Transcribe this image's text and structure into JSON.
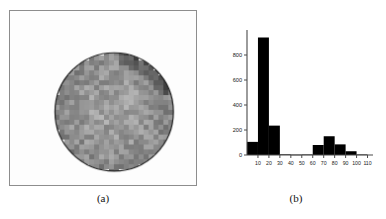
{
  "figure": {
    "panel_a": {
      "caption": "(a)",
      "description": "grayscale pixelated circular object on light background with thin frame border",
      "frame_color": "#8d8d8d",
      "background_color": "#fdfdfd",
      "circle": {
        "center_x_pct": 56,
        "center_y_pct": 58,
        "radius_pct": 34,
        "outline_color": "#1e1e1e",
        "mean_gray": "#9a9a9a",
        "texture": "blocky 12x12 pixel mosaic, darker patch at upper-right rim"
      }
    },
    "panel_b": {
      "caption": "(b)"
    }
  },
  "chart_data": {
    "type": "bar",
    "title": "",
    "xlabel": "",
    "ylabel": "",
    "xlim": [
      0,
      115
    ],
    "ylim": [
      0,
      1000
    ],
    "grid": false,
    "legend": null,
    "bin_width": 10,
    "bar_color": "#000000",
    "axis_color": "#4a4a4a",
    "xticks": [
      10,
      20,
      30,
      40,
      50,
      60,
      70,
      80,
      90,
      100,
      110
    ],
    "xtick_labels": [
      "10",
      "20",
      "30",
      "40",
      "50",
      "60",
      "70",
      "80",
      "90",
      "100",
      "110"
    ],
    "yticks": [
      0,
      200,
      400,
      600,
      800
    ],
    "ytick_labels": [
      "0",
      "200",
      "400",
      "600",
      "800"
    ],
    "bin_edges": [
      0,
      10,
      20,
      30,
      40,
      50,
      60,
      70,
      80,
      90,
      100,
      110
    ],
    "categories": [
      "0-10",
      "10-20",
      "20-30",
      "30-40",
      "40-50",
      "50-60",
      "60-70",
      "70-80",
      "80-90",
      "90-100",
      "100-110"
    ],
    "values": [
      105,
      940,
      235,
      5,
      3,
      4,
      80,
      150,
      85,
      30,
      4
    ]
  }
}
